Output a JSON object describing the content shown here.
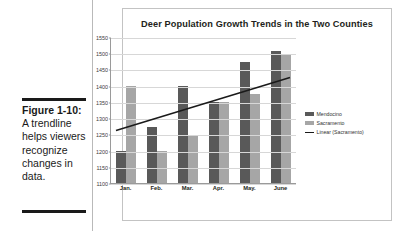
{
  "caption": {
    "figure_number": "Figure 1-10:",
    "text": "A trendline helps viewers recognize changes in data."
  },
  "chart_data": {
    "type": "bar",
    "title": "Deer Population Growth Trends in the Two Counties",
    "xlabel": "",
    "ylabel": "",
    "categories": [
      "Jan.",
      "Feb.",
      "Mar.",
      "Apr.",
      "May.",
      "June"
    ],
    "series": [
      {
        "name": "Mendocino",
        "values": [
          1200,
          1275,
          1400,
          1350,
          1475,
          1510
        ],
        "color": "#595959"
      },
      {
        "name": "Sacramento",
        "values": [
          1400,
          1200,
          1250,
          1350,
          1375,
          1500
        ],
        "color": "#a6a6a6"
      }
    ],
    "trendline": {
      "name": "Linear (Sacramento)",
      "start_value": 1265,
      "end_value": 1428,
      "color": "#1a1a1a"
    },
    "ylim": [
      1100,
      1550
    ],
    "ytick_step": 50,
    "yticks": [
      1100,
      1150,
      1200,
      1250,
      1300,
      1350,
      1400,
      1450,
      1500,
      1550
    ],
    "grid": true,
    "legend_position": "right",
    "legend": [
      "Mendocino",
      "Sacramento",
      "Linear (Sacramento)"
    ]
  }
}
